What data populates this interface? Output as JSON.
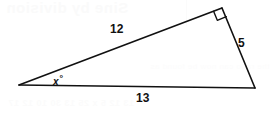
{
  "figure": {
    "width": 270,
    "height": 113,
    "background_color": "#ffffff",
    "stroke_color": "#111111",
    "ghost_color": "#fbfbfb"
  },
  "ghost": {
    "title": "Sine by division",
    "middle_line": "the ratio can now be found as",
    "bottom_line": "13   12   5   x   25   13   30   10   12   17"
  },
  "diagram": {
    "type": "right-triangle",
    "vertices": {
      "left": {
        "x": 19,
        "y": 85
      },
      "top_right": {
        "x": 222,
        "y": 8
      },
      "bottom_right": {
        "x": 255,
        "y": 88
      }
    },
    "right_angle_marker": {
      "at_vertex": "top_right",
      "size": 9
    },
    "sides": [
      {
        "name": "hypotenuse-adjacent",
        "from": "left",
        "to": "top_right",
        "label": "12"
      },
      {
        "name": "opposite",
        "from": "top_right",
        "to": "bottom_right",
        "label": "5"
      },
      {
        "name": "base",
        "from": "left",
        "to": "bottom_right",
        "label": "13"
      }
    ],
    "angles": [
      {
        "name": "unknown-angle",
        "at_vertex": "left",
        "label": "x",
        "unit": "°"
      }
    ]
  },
  "labels": {
    "side_12": "12",
    "side_5": "5",
    "side_13": "13",
    "angle_x": "x",
    "degree_symbol": "°"
  }
}
